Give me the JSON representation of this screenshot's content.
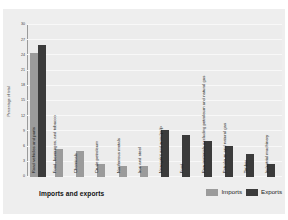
{
  "chart_data": {
    "type": "bar",
    "title": "",
    "xlabel": "Imports and exports",
    "ylabel": "Percentage of total",
    "ylim": [
      0,
      30
    ],
    "yticks": [
      0,
      3,
      6,
      9,
      12,
      15,
      18,
      21,
      24,
      27,
      30
    ],
    "grid": true,
    "legend_position": "bottom-right",
    "legend": [
      "Imports",
      "Exports"
    ],
    "colors": {
      "imports": "#9b9b9b",
      "exports": "#3b3b3b",
      "plot_bg": "#ececec",
      "panel_bg": "#eeeeee"
    },
    "categories": [
      "Road vehicles and parts",
      "Food, beverages, and tobacco",
      "Chemicals",
      "Crude petroleum",
      "Nonferrous metals",
      "Iron and steel",
      "Newsprint and woodpulp",
      "Food",
      "Raw materials excluding petroleum and natural gas",
      "Petroleum and natural gas",
      "Timber",
      "Industrial machinery"
    ],
    "series": [
      {
        "name": "Imports",
        "values": [
          24.5,
          5.5,
          5.2,
          2.6,
          2.2,
          2.2,
          null,
          null,
          null,
          null,
          null,
          null
        ]
      },
      {
        "name": "Exports",
        "values": [
          26.0,
          null,
          null,
          null,
          null,
          null,
          9.3,
          8.2,
          7.1,
          6.1,
          4.5,
          2.6
        ]
      }
    ]
  },
  "footer": {
    "x_title": "Imports and exports",
    "legend_imports": "Imports",
    "legend_exports": "Exports"
  }
}
